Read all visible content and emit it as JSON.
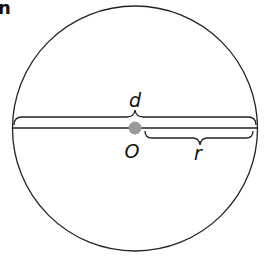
{
  "header": {
    "partial_text": "n"
  },
  "diagram": {
    "type": "circle-diameter-radius",
    "center_label": "O",
    "diameter_label": "d",
    "radius_label": "r",
    "colors": {
      "stroke": "#222222",
      "center_point": "#9a9a9a",
      "background": "#ffffff"
    }
  }
}
